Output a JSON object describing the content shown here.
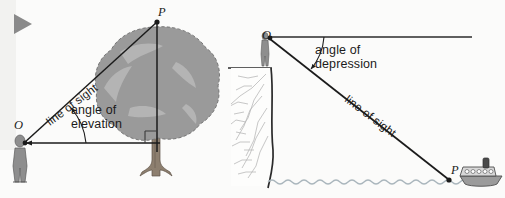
{
  "diagram": {
    "background_color": "#fbfbfa",
    "ink_color": "#1b1b1b",
    "panels": [
      {
        "id": "elevation",
        "name": "angle-of-elevation-diagram",
        "angle_label": "angle of\nelevation",
        "angle_label_line1": "angle of",
        "angle_label_line2": "elevation",
        "line_of_sight_label": "line of sight",
        "observer_point_label": "O",
        "target_point_label": "P",
        "objects": [
          "person",
          "tree",
          "ground-line",
          "right-angle-marker"
        ]
      },
      {
        "id": "depression",
        "name": "angle-of-depression-diagram",
        "angle_label_line1": "angle of",
        "angle_label_line2": "depression",
        "line_of_sight_label": "line of sight",
        "observer_point_label": "O",
        "target_point_label": "P",
        "objects": [
          "person",
          "cliff",
          "horizontal-line",
          "boat",
          "water-line"
        ]
      }
    ],
    "colors": {
      "tree_canopy": "#9a9a9a",
      "tree_canopy_shade": "#b4b4b4",
      "tree_trunk": "#8d7f6f",
      "person_body": "#8c8c8c",
      "boat_hull": "#9b9b9b",
      "water": "#b9c4cb",
      "cliff_face": "#cfcfcf",
      "marker_triangle": "#8a8a8a"
    },
    "marker": {
      "name": "play-triangle-marker",
      "glyph": "▶"
    }
  }
}
